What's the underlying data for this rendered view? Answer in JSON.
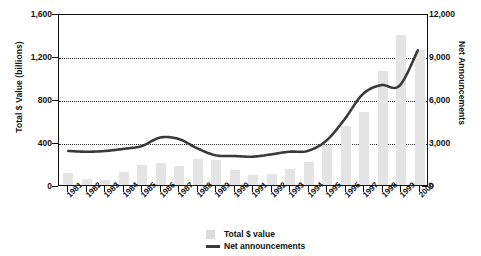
{
  "chart_data": {
    "type": "bar",
    "title": "",
    "xlabel": "",
    "ylabel": "Total $ Value (billions)",
    "y2label": "Net Announcements",
    "grid": true,
    "legend_position": "bottom-center",
    "categories": [
      "1981",
      "1982",
      "1983",
      "1984",
      "1985",
      "1986",
      "1987",
      "1988",
      "1989",
      "1990",
      "1991",
      "1992",
      "1993",
      "1994",
      "1995",
      "1996",
      "1997",
      "1998",
      "1999",
      "2000"
    ],
    "ylim": [
      0,
      1600
    ],
    "yticks": [
      "0",
      "400",
      "800",
      "1,200",
      "1,600"
    ],
    "ytick_values": [
      0,
      400,
      800,
      1200,
      1600
    ],
    "y2lim": [
      0,
      12000
    ],
    "y2ticks": [
      "0",
      "3,000",
      "6,000",
      "9,000",
      "12,000"
    ],
    "y2tick_values": [
      0,
      3000,
      6000,
      9000,
      12000
    ],
    "series": [
      {
        "name": "Total $ value",
        "type": "bar",
        "axis": "left",
        "color": "#e4e4e4",
        "values": [
          110,
          60,
          50,
          125,
          190,
          205,
          175,
          245,
          230,
          140,
          95,
          100,
          150,
          215,
          370,
          550,
          675,
          1060,
          1400,
          1260
        ]
      },
      {
        "name": "Net announcements",
        "type": "line",
        "axis": "right",
        "color": "#3a3a3a",
        "values": [
          2400,
          2350,
          2400,
          2550,
          2750,
          3350,
          3250,
          2600,
          2100,
          2050,
          2000,
          2150,
          2350,
          2400,
          3100,
          4600,
          6400,
          7050,
          7000,
          9500
        ]
      }
    ],
    "legend": [
      {
        "label": "Total $ value",
        "marker": "bar-swatch"
      },
      {
        "label": "Net announcements",
        "marker": "line-swatch"
      }
    ]
  }
}
